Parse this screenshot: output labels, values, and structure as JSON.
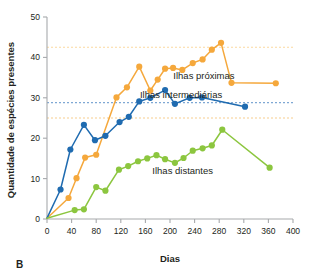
{
  "panel": {
    "label": "B"
  },
  "colors": {
    "near": "#F5A83C",
    "intermediate": "#1F6BB0",
    "far": "#8CC63F",
    "axis": "#a7a9ac",
    "text": "#231f20",
    "ref_near": "#FBD9A0",
    "ref_intermediate": "#7FA8D4",
    "ref_far": "#F7CD8E"
  },
  "chart_data": {
    "type": "line",
    "title": "",
    "xlabel": "Dias",
    "ylabel": "Quantidade de espécies presentes",
    "xlim": [
      0,
      400
    ],
    "ylim": [
      0,
      50
    ],
    "xticks": [
      0,
      40,
      80,
      120,
      160,
      200,
      240,
      280,
      320,
      360,
      400
    ],
    "yticks": [
      0,
      10,
      20,
      30,
      40,
      50
    ],
    "xtick_labels": [
      "0",
      "40",
      "80",
      "120",
      "160",
      "200",
      "240",
      "280",
      "320",
      "360",
      "400"
    ],
    "ytick_labels": [
      "0",
      "10",
      "20",
      "30",
      "40",
      "50"
    ],
    "grid": false,
    "legend_position": "inline-right",
    "reference_lines": [
      {
        "name": "Ilhas próximas equilíbrio",
        "y": 42.5,
        "color": "#FBD9A0"
      },
      {
        "name": "Ilhas intermediárias equilíbrio",
        "y": 28.8,
        "color": "#7FA8D4"
      },
      {
        "name": "Ilhas distantes equilíbrio",
        "y": 25.0,
        "color": "#F7CD8E"
      }
    ],
    "series": [
      {
        "name": "Ilhas próximas",
        "color": "#F5A83C",
        "label_x": 305,
        "label_y": 35.5,
        "points": [
          [
            0,
            0.2
          ],
          [
            35,
            5.2
          ],
          [
            48,
            10.1
          ],
          [
            62,
            15.2
          ],
          [
            80,
            15.9
          ],
          [
            113,
            30.1
          ],
          [
            130,
            32.6
          ],
          [
            150,
            37.7
          ],
          [
            168,
            31.8
          ],
          [
            180,
            34.5
          ],
          [
            192,
            37.2
          ],
          [
            205,
            37.4
          ],
          [
            220,
            36.9
          ],
          [
            237,
            38.6
          ],
          [
            253,
            39.5
          ],
          [
            268,
            41.9
          ],
          [
            283,
            43.6
          ],
          [
            300,
            33.7
          ],
          [
            372,
            33.6
          ]
        ]
      },
      {
        "name": "Ilhas intermediárias",
        "color": "#1F6BB0",
        "label_x": 285,
        "label_y": 30.6,
        "points": [
          [
            0,
            0.2
          ],
          [
            22,
            7.3
          ],
          [
            38,
            17.2
          ],
          [
            60,
            23.3
          ],
          [
            78,
            19.5
          ],
          [
            95,
            20.6
          ],
          [
            118,
            24.0
          ],
          [
            133,
            25.3
          ],
          [
            150,
            29.1
          ],
          [
            168,
            30.0
          ],
          [
            192,
            31.9
          ],
          [
            208,
            28.5
          ],
          [
            232,
            30.0
          ],
          [
            252,
            30.1
          ],
          [
            322,
            27.8
          ]
        ]
      },
      {
        "name": "Ilhas distantes",
        "color": "#8CC63F",
        "label_x": 270,
        "label_y": 11.8,
        "points": [
          [
            0,
            0.2
          ],
          [
            45,
            2.2
          ],
          [
            60,
            2.4
          ],
          [
            80,
            7.9
          ],
          [
            95,
            7.0
          ],
          [
            117,
            12.2
          ],
          [
            132,
            13.1
          ],
          [
            148,
            14.3
          ],
          [
            163,
            15.0
          ],
          [
            178,
            15.8
          ],
          [
            192,
            14.8
          ],
          [
            208,
            13.9
          ],
          [
            222,
            15.1
          ],
          [
            237,
            16.9
          ],
          [
            253,
            17.5
          ],
          [
            268,
            18.2
          ],
          [
            285,
            22.1
          ],
          [
            362,
            12.7
          ]
        ]
      }
    ]
  }
}
